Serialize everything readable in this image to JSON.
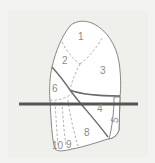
{
  "diagram": {
    "labels": [
      {
        "id": "seg-1",
        "text": "1",
        "x": 78,
        "y": 40
      },
      {
        "id": "seg-2",
        "text": "2",
        "x": 62,
        "y": 64
      },
      {
        "id": "seg-3",
        "text": "3",
        "x": 100,
        "y": 74
      },
      {
        "id": "seg-6",
        "text": "6",
        "x": 52,
        "y": 92
      },
      {
        "id": "seg-4",
        "text": "4",
        "x": 97,
        "y": 112
      },
      {
        "id": "seg-5",
        "text": "5",
        "x": 113,
        "y": 122
      },
      {
        "id": "seg-8",
        "text": "8",
        "x": 84,
        "y": 136
      },
      {
        "id": "seg-9",
        "text": "9",
        "x": 66,
        "y": 148
      },
      {
        "id": "seg-10",
        "text": "10",
        "x": 52,
        "y": 149
      }
    ],
    "colors": {
      "background": "#f3f3f1",
      "outline": "#7a7a78",
      "fissure": "#6a6a6a",
      "dashed": "#9a9a98",
      "plane": "#555555",
      "label": "#8a8a88"
    }
  }
}
